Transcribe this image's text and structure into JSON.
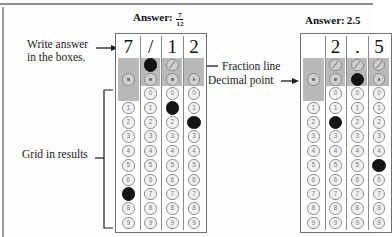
{
  "document": {
    "kind": "test-answer-grid-illustration",
    "background": "#fdfdfd",
    "ink_color": "#141414",
    "band_color": "#b9b9b9",
    "bubble_outline": "#8d8d8d"
  },
  "annotations": {
    "write_answer": "Write answer\nin the boxes.",
    "write_answer_line1": "Write answer",
    "write_answer_line2": "in the boxes.",
    "fraction_line": "Fraction line",
    "decimal_point": "Decimal point",
    "grid_in_results": "Grid in results"
  },
  "grids": [
    {
      "id": "fraction-grid",
      "caption_prefix": "Answer:",
      "caption_value_numerator": "7",
      "caption_value_denominator": "12",
      "caption_is_fraction": true,
      "written": [
        "7",
        "/",
        "1",
        "2"
      ],
      "columns": [
        {
          "index": 0,
          "has_slash_bubble": false,
          "slash_filled": false,
          "decimal_filled": false,
          "has_zero": false,
          "filled_digit": "7"
        },
        {
          "index": 1,
          "has_slash_bubble": true,
          "slash_filled": true,
          "decimal_filled": false,
          "has_zero": true,
          "filled_digit": null
        },
        {
          "index": 2,
          "has_slash_bubble": true,
          "slash_filled": false,
          "decimal_filled": false,
          "has_zero": true,
          "filled_digit": "1"
        },
        {
          "index": 3,
          "has_slash_bubble": false,
          "slash_filled": false,
          "decimal_filled": false,
          "has_zero": true,
          "filled_digit": "2"
        }
      ]
    },
    {
      "id": "decimal-grid",
      "caption_prefix": "Answer:",
      "caption_value": "2.5",
      "caption_is_fraction": false,
      "written": [
        "",
        "2",
        ".",
        "5"
      ],
      "columns": [
        {
          "index": 0,
          "has_slash_bubble": false,
          "slash_filled": false,
          "decimal_filled": false,
          "has_zero": false,
          "filled_digit": null
        },
        {
          "index": 1,
          "has_slash_bubble": true,
          "slash_filled": false,
          "decimal_filled": false,
          "has_zero": true,
          "filled_digit": "2"
        },
        {
          "index": 2,
          "has_slash_bubble": true,
          "slash_filled": false,
          "decimal_filled": true,
          "has_zero": true,
          "filled_digit": null
        },
        {
          "index": 3,
          "has_slash_bubble": true,
          "slash_filled": false,
          "decimal_filled": false,
          "has_zero": true,
          "filled_digit": "5"
        }
      ]
    }
  ],
  "digits": [
    "0",
    "1",
    "2",
    "3",
    "4",
    "5",
    "6",
    "7",
    "8",
    "9"
  ]
}
